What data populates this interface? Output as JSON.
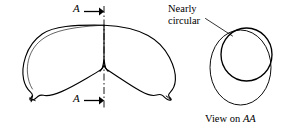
{
  "figure": {
    "background_color": "#ffffff",
    "line_color": "#000000",
    "labels": {
      "section_marker_top": "A",
      "section_marker_bottom": "A",
      "callout_line1": "Nearly",
      "callout_line2": "circular",
      "view_caption_prefix": "View on ",
      "view_caption_section": "AA"
    },
    "views": {
      "main": {
        "name": "crescent-plan-view",
        "description": "Crescent / banana shaped outline with a sharp upward cusp notch at bottom centre and small pointed tips at left and right ends",
        "centerline_style": "dash-dot",
        "centerline_x": 104
      },
      "section": {
        "name": "section-aa-view",
        "description": "Two overlapping ovals: larger outer oval with a smaller nearly circular inner profile offset up and to the right",
        "outer_shape": "oval",
        "inner_shape": "nearly circular"
      }
    }
  }
}
